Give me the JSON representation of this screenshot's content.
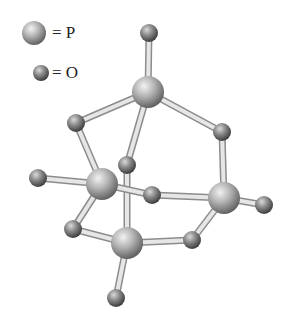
{
  "diagram": {
    "legend": [
      {
        "symbol": "P",
        "label": "= P",
        "cx": 34,
        "cy": 33,
        "r": 12
      },
      {
        "symbol": "O",
        "label": "= O",
        "cx": 41,
        "cy": 73,
        "r": 8
      }
    ],
    "atoms": [
      {
        "id": "O_top",
        "el": "O",
        "x": 149,
        "y": 33
      },
      {
        "id": "P_top",
        "el": "P",
        "x": 148,
        "y": 92
      },
      {
        "id": "O_ul",
        "el": "O",
        "x": 76,
        "y": 123
      },
      {
        "id": "O_ur",
        "el": "O",
        "x": 222,
        "y": 132
      },
      {
        "id": "O_c",
        "el": "O",
        "x": 127,
        "y": 165
      },
      {
        "id": "P_left",
        "el": "P",
        "x": 102,
        "y": 184
      },
      {
        "id": "P_right",
        "el": "P",
        "x": 224,
        "y": 198
      },
      {
        "id": "O_left",
        "el": "O",
        "x": 38,
        "y": 178
      },
      {
        "id": "O_right",
        "el": "O",
        "x": 264,
        "y": 205
      },
      {
        "id": "O_mid",
        "el": "O",
        "x": 152,
        "y": 195
      },
      {
        "id": "O_ll",
        "el": "O",
        "x": 73,
        "y": 229
      },
      {
        "id": "P_bot",
        "el": "P",
        "x": 127,
        "y": 243
      },
      {
        "id": "O_lr",
        "el": "O",
        "x": 192,
        "y": 240
      },
      {
        "id": "O_bot",
        "el": "O",
        "x": 116,
        "y": 298
      }
    ],
    "bonds": [
      [
        "O_top",
        "P_top"
      ],
      [
        "P_top",
        "O_ul"
      ],
      [
        "P_top",
        "O_ur"
      ],
      [
        "P_top",
        "O_c"
      ],
      [
        "O_ul",
        "P_left"
      ],
      [
        "O_ur",
        "P_right"
      ],
      [
        "O_c",
        "P_bot"
      ],
      [
        "P_left",
        "O_left"
      ],
      [
        "P_left",
        "O_mid"
      ],
      [
        "O_mid",
        "P_right"
      ],
      [
        "P_right",
        "O_right"
      ],
      [
        "P_left",
        "O_ll"
      ],
      [
        "O_ll",
        "P_bot"
      ],
      [
        "P_bot",
        "O_lr"
      ],
      [
        "O_lr",
        "P_right"
      ],
      [
        "P_bot",
        "O_bot"
      ]
    ],
    "radii": {
      "P": 16,
      "O": 9
    }
  }
}
